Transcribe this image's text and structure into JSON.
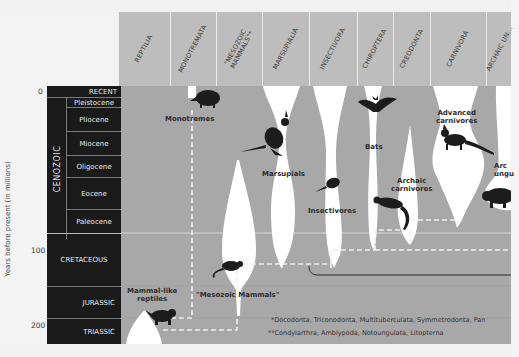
{
  "columns": [
    {
      "label": "REPTILIA"
    },
    {
      "label": "MONOTREMATA"
    },
    {
      "label": "\"MESOZOIC MAMMALS\"*"
    },
    {
      "label": "MARSUPIALIA"
    },
    {
      "label": "INSECTIVORA"
    },
    {
      "label": "CHIROPTERA"
    },
    {
      "label": "CREODONTA"
    },
    {
      "label": "CARNIVORA"
    },
    {
      "label": "ARCHAIC UN..."
    }
  ],
  "axis": {
    "label": "Years before present (in millions)",
    "ticks": [
      "0",
      "100",
      "200"
    ]
  },
  "eras": {
    "cenozoic": "CENOZOIC",
    "recent": "RECENT",
    "epochs": [
      "Pleistocene",
      "Pliocene",
      "Miocene",
      "Oligocene",
      "Eocene",
      "Paleocene"
    ],
    "periods": [
      "CRETACEOUS",
      "JURASSIC",
      "TRIASSIC"
    ]
  },
  "groups": {
    "monotremes": "Monotremes",
    "marsupials": "Marsupials",
    "insectivores": "Insectivores",
    "bats": "Bats",
    "advanced_carnivores_1": "Advanced",
    "advanced_carnivores_2": "carnivores",
    "archaic_carnivores_1": "Archaic",
    "archaic_carnivores_2": "carnivores",
    "archaic_ungulates_1": "Arc",
    "archaic_ungulates_2": "ungu",
    "mammal_like_reptiles_1": "Mammal-like",
    "mammal_like_reptiles_2": "reptiles",
    "mesozoic_mammals": "\"Mesozoic Mammals\""
  },
  "footnotes": {
    "single": "*Docodonta, Triconodonta, Multituberculata, Symmetrodonta, Pan",
    "double": "**Condylarthra, Amblypoda, Notoungulata, Litopterna"
  },
  "colors": {
    "background": "#a8a8a8",
    "header": "#bdbdbd",
    "era_column": "#1a1a1a",
    "spindle": "#ffffff",
    "animal": "#1c1c1c"
  }
}
